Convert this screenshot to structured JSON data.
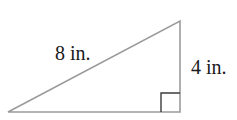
{
  "figure": {
    "type": "right-triangle-diagram",
    "labels": {
      "hypotenuse": "8 in.",
      "vertical_side": "4 in."
    },
    "colors": {
      "triangle_stroke": "#9b9b9b",
      "right_angle_marker": "#3c3c3c",
      "label_text": "#1a1a1a",
      "background": "#ffffff"
    }
  }
}
